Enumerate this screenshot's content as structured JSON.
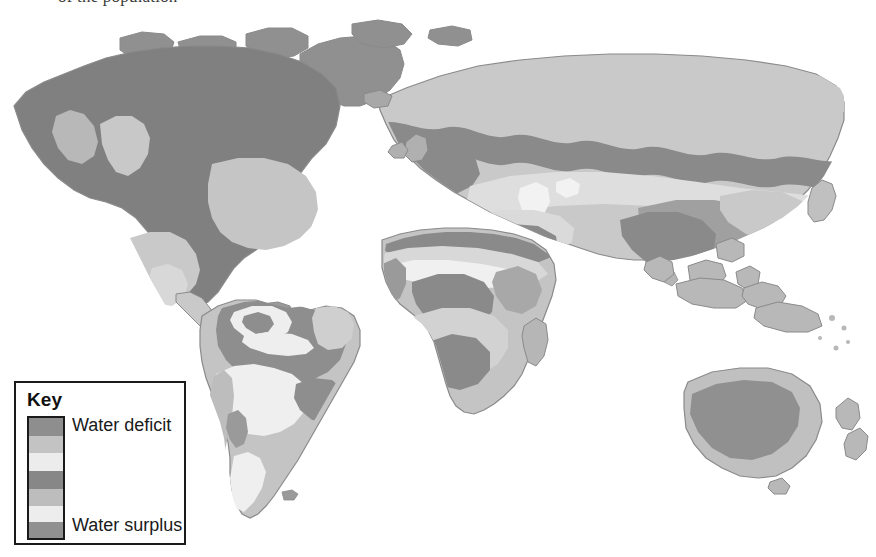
{
  "page": {
    "background_color": "#ffffff",
    "width": 876,
    "height": 557,
    "cutoff_text": "of the population"
  },
  "legend": {
    "title": "Key",
    "top_label": "Water deficit",
    "bottom_label": "Water surplus",
    "border_color": "#1a1a1a",
    "bands": [
      {
        "name": "band-1-deficit-high",
        "color": "#8e8e8e",
        "height_pct": 15
      },
      {
        "name": "band-2-deficit-mid",
        "color": "#c3c3c3",
        "height_pct": 14
      },
      {
        "name": "band-3-deficit-low",
        "color": "#ececec",
        "height_pct": 15
      },
      {
        "name": "band-4-neutral",
        "color": "#878787",
        "height_pct": 15
      },
      {
        "name": "band-5-surplus-low",
        "color": "#bdbdbd",
        "height_pct": 14
      },
      {
        "name": "band-6-surplus-mid",
        "color": "#ededed",
        "height_pct": 14
      },
      {
        "name": "band-7-surplus-high",
        "color": "#909090",
        "height_pct": 13
      }
    ]
  },
  "map": {
    "type": "world-thematic-choropleth",
    "subject": "Global water deficit and surplus",
    "projection": "equirectangular-like world map",
    "land_outline_color": "#8a8a8a",
    "ocean_color": "#ffffff",
    "shade_levels": {
      "deficit_high": "#8e8e8e",
      "deficit_mid": "#c3c3c3",
      "deficit_low": "#ececec",
      "neutral": "#878787",
      "surplus_low": "#bdbdbd",
      "surplus_mid": "#ededed",
      "surplus_high": "#909090"
    },
    "regions": [
      {
        "name": "north-america",
        "dominant_level": "neutral"
      },
      {
        "name": "central-america",
        "dominant_level": "deficit_mid"
      },
      {
        "name": "south-america",
        "dominant_level": "surplus_low"
      },
      {
        "name": "europe",
        "dominant_level": "neutral"
      },
      {
        "name": "africa",
        "dominant_level": "deficit_mid"
      },
      {
        "name": "asia",
        "dominant_level": "deficit_mid"
      },
      {
        "name": "australia",
        "dominant_level": "deficit_high"
      },
      {
        "name": "new-zealand",
        "dominant_level": "deficit_mid"
      },
      {
        "name": "greenland",
        "dominant_level": "neutral"
      }
    ]
  }
}
